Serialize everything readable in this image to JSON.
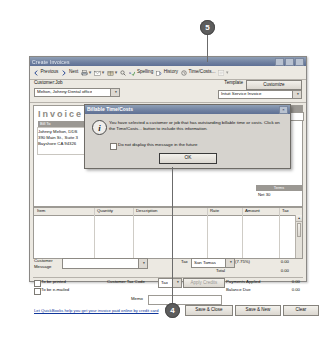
{
  "window": {
    "title": "Create Invoices",
    "minimize": "_",
    "maximize": "□",
    "close": "×"
  },
  "toolbar": {
    "previous": "Previous",
    "next": "Next",
    "print": "Print",
    "send": "Send",
    "ship": "Ship",
    "find": "Find",
    "spelling": "Spelling",
    "history": "History",
    "time_costs": "Time/Costs...",
    "letters": "Letters",
    "dropdown_caret": "▾"
  },
  "header": {
    "customer_job_label": "Customer:Job",
    "customer_job_value": "Melton, Johnny:Dental office",
    "template_label": "Template",
    "customize_button": "Customize",
    "template_value": "Intuit Service Invoice"
  },
  "invoice": {
    "title": "Invoice",
    "bill_to_label": "Bill To",
    "address_lines": [
      "Johnny Melton, DDS",
      "390 Main St., Suite 3",
      "Bayshore CA 94326"
    ],
    "date_header": "Date",
    "invoice_no_header": "Invoice #",
    "invoice_no_value": "10",
    "terms_header": "Terms",
    "terms_value": "Net 30"
  },
  "grid": {
    "columns": [
      "Item",
      "Quantity",
      "Description",
      "Rate",
      "Amount",
      "Tax"
    ]
  },
  "totals": {
    "customer_message_label": "Customer\nMessage",
    "tax_label": "Tax",
    "tax_value": "San Tomas",
    "tax_rate": "(7.75%)",
    "tax_amount": "0.00",
    "total_label": "Total",
    "total_amount": "0.00",
    "payments_applied_label": "Payments Applied",
    "payments_applied_amount": "0.00",
    "balance_due_label": "Balance Due",
    "balance_due_amount": "0.00",
    "to_be_printed": "To be printed",
    "to_be_emailed": "To be e-mailed",
    "customer_tax_code_label": "Customer Tax Code",
    "customer_tax_code_value": "Tax",
    "apply_credits_button": "Apply Credits",
    "memo_label": "Memo",
    "online_link": "Let QuickBooks help you get your invoice paid online by credit card",
    "save_close_button": "Save & Close",
    "save_new_button": "Save & New",
    "clear_button": "Clear"
  },
  "dialog": {
    "title": "Billable Time/Costs",
    "close": "×",
    "icon": "i",
    "message": "You have selected a customer or job that has outstanding billable time or costs. Click on the Time/Costs... button to include this information.",
    "checkbox_label": "Do not display this message in the future",
    "ok_button": "OK",
    "ok_accel": "O"
  },
  "callouts": [
    {
      "number": "5"
    },
    {
      "number": "4"
    }
  ],
  "colors": {
    "titlebar": "#6f80a0",
    "window_face": "#d6d3ce",
    "band": "#9b9893",
    "link": "#12389c"
  }
}
